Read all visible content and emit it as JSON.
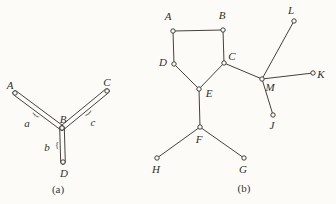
{
  "palette": {
    "paper": "#fcfbf8",
    "line": "#45413a",
    "label": "#322f29"
  },
  "diagram": {
    "type": "graph-figures",
    "figures": [
      {
        "id": "a",
        "caption": "(a)",
        "vertices": [
          {
            "id": "A",
            "x": 15,
            "y": 93,
            "lx": 10,
            "ly": 85
          },
          {
            "id": "B",
            "x": 62,
            "y": 128,
            "lx": 63,
            "ly": 119
          },
          {
            "id": "C",
            "x": 107,
            "y": 91,
            "lx": 107,
            "ly": 82
          },
          {
            "id": "D",
            "x": 63,
            "y": 162,
            "lx": 64,
            "ly": 173
          }
        ],
        "double_edges": [
          {
            "from": "A",
            "to": "B",
            "label": "a",
            "label_x": 27,
            "label_y": 123
          },
          {
            "from": "B",
            "to": "C",
            "label": "c",
            "label_x": 93,
            "label_y": 122
          },
          {
            "from": "B",
            "to": "D",
            "label": "b",
            "label_x": 47,
            "label_y": 147
          }
        ],
        "edges": []
      },
      {
        "id": "b",
        "caption": "(b)",
        "vertices": [
          {
            "id": "A",
            "x": 173,
            "y": 31,
            "lx": 168,
            "ly": 16
          },
          {
            "id": "B",
            "x": 223,
            "y": 30,
            "lx": 222,
            "ly": 15
          },
          {
            "id": "C",
            "x": 224,
            "y": 63,
            "lx": 232,
            "ly": 56
          },
          {
            "id": "D",
            "x": 174,
            "y": 64,
            "lx": 163,
            "ly": 62
          },
          {
            "id": "E",
            "x": 199,
            "y": 89,
            "lx": 209,
            "ly": 93
          },
          {
            "id": "F",
            "x": 200,
            "y": 127,
            "lx": 199,
            "ly": 139
          },
          {
            "id": "G",
            "x": 244,
            "y": 158,
            "lx": 243,
            "ly": 169
          },
          {
            "id": "H",
            "x": 157,
            "y": 158,
            "lx": 156,
            "ly": 169
          },
          {
            "id": "J",
            "x": 273,
            "y": 115,
            "lx": 272,
            "ly": 125
          },
          {
            "id": "K",
            "x": 313,
            "y": 73,
            "lx": 321,
            "ly": 74
          },
          {
            "id": "L",
            "x": 294,
            "y": 21,
            "lx": 291,
            "ly": 10
          },
          {
            "id": "M",
            "x": 262,
            "y": 79,
            "lx": 270,
            "ly": 87
          }
        ],
        "double_edges": [],
        "edges": [
          [
            "A",
            "B"
          ],
          [
            "A",
            "D"
          ],
          [
            "B",
            "C"
          ],
          [
            "D",
            "E"
          ],
          [
            "C",
            "E"
          ],
          [
            "C",
            "M"
          ],
          [
            "E",
            "F"
          ],
          [
            "F",
            "H"
          ],
          [
            "F",
            "G"
          ],
          [
            "M",
            "L"
          ],
          [
            "M",
            "K"
          ],
          [
            "M",
            "J"
          ]
        ]
      }
    ]
  }
}
